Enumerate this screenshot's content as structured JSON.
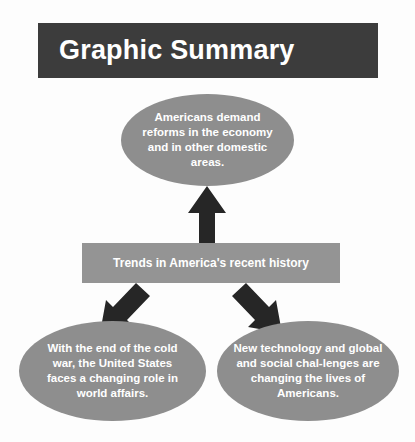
{
  "figure": {
    "name": "Graphic Summary",
    "type": "concept-flow-diagram"
  },
  "header": {
    "title": "Graphic Summary",
    "background_color": "#3c3c3c",
    "text_color": "#ffffff"
  },
  "theme": {
    "page_background": "#fdfdfd",
    "node_fill": "#8e8e8e",
    "box_fill": "#949494",
    "arrow_fill": "#262626",
    "node_text_color": "#ffffff"
  },
  "nodes": {
    "top_ellipse": {
      "shape": "ellipse",
      "text": "Americans demand reforms in the economy and in other domestic areas."
    },
    "center_box": {
      "shape": "rectangle",
      "text": "Trends in America's recent history"
    },
    "bottom_left_ellipse": {
      "shape": "ellipse",
      "text": "With the end of the cold war, the United States faces a changing role in world affairs."
    },
    "bottom_right_ellipse": {
      "shape": "ellipse",
      "text": "New technology and global and social chal-lenges are changing the lives of Americans."
    }
  },
  "connectors": [
    {
      "name": "arrow-up",
      "icon": "arrow-up-icon",
      "direction": "up",
      "from": "center_box",
      "to": "top_ellipse"
    },
    {
      "name": "arrow-down-left",
      "icon": "arrow-down-left-icon",
      "direction": "down-left",
      "from": "center_box",
      "to": "bottom_left_ellipse"
    },
    {
      "name": "arrow-down-right",
      "icon": "arrow-down-right-icon",
      "direction": "down-right",
      "from": "center_box",
      "to": "bottom_right_ellipse"
    }
  ]
}
